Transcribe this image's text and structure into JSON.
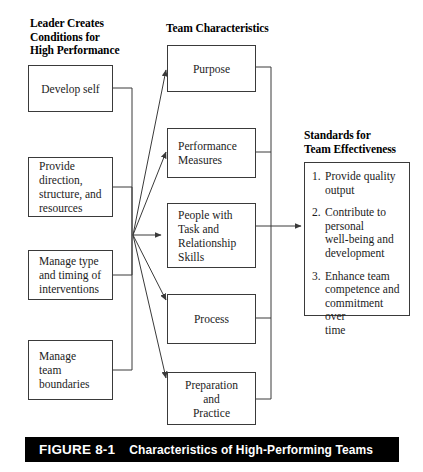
{
  "figure": {
    "caption_number": "FIGURE 8-1",
    "caption_title": "Characteristics of High-Performing Teams",
    "page_mark": ""
  },
  "headings": {
    "left": "Leader Creates\nConditions for\nHigh Performance",
    "middle": "Team Characteristics",
    "right": "Standards for\nTeam Effectiveness"
  },
  "leader_conditions": [
    {
      "label": "Develop self"
    },
    {
      "label": "Provide\ndirection,\nstructure, and\nresources"
    },
    {
      "label": "Manage type\nand timing of\ninterventions"
    },
    {
      "label": "Manage\nteam\nboundaries"
    }
  ],
  "team_characteristics": [
    {
      "label": "Purpose"
    },
    {
      "label": "Performance\nMeasures"
    },
    {
      "label": "People with\nTask and\nRelationship\nSkills"
    },
    {
      "label": "Process"
    },
    {
      "label": "Preparation\nand\nPractice"
    }
  ],
  "standards": [
    {
      "number": "1.",
      "text": "Provide quality\noutput"
    },
    {
      "number": "2.",
      "text": "Contribute to\npersonal\nwell-being and\ndevelopment"
    },
    {
      "number": "3.",
      "text": "Enhance team\ncompetence and\ncommitment over\ntime"
    }
  ],
  "colors": {
    "line": "#3a3a3a",
    "box_border": "#3a3a3a",
    "caption_bg": "#000000",
    "caption_fg": "#ffffff",
    "background": "#ffffff",
    "text": "#1c1c1c"
  }
}
